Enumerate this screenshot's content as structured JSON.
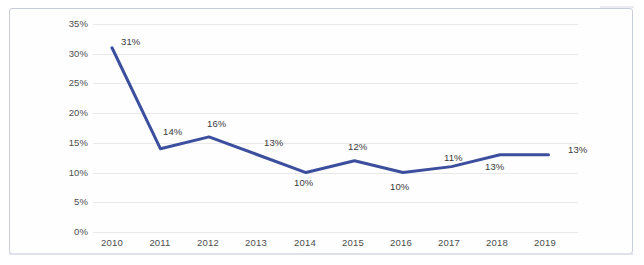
{
  "chart_data": {
    "type": "line",
    "title": "",
    "subtitle": "",
    "xlabel": "",
    "ylabel": "",
    "categories": [
      "2010",
      "2011",
      "2012",
      "2013",
      "2014",
      "2015",
      "2016",
      "2017",
      "2018",
      "2019"
    ],
    "values": [
      31,
      14,
      16,
      13,
      10,
      12,
      10,
      11,
      13,
      13
    ],
    "data_labels": [
      "31%",
      "14%",
      "16%",
      "13%",
      "10%",
      "12%",
      "10%",
      "11%",
      "13%",
      "13%"
    ],
    "series": [
      {
        "name": "",
        "values": [
          31,
          14,
          16,
          13,
          10,
          12,
          10,
          11,
          13,
          13
        ],
        "color": "#3c4f9e"
      }
    ],
    "ylim": [
      0,
      35
    ],
    "ytick_values": [
      0,
      5,
      10,
      15,
      20,
      25,
      30,
      35
    ],
    "ytick_labels": [
      "0%",
      "5%",
      "10%",
      "15%",
      "20%",
      "25%",
      "30%",
      "35%"
    ],
    "xtick_labels": [
      "2010",
      "2011",
      "2012",
      "2013",
      "2014",
      "2015",
      "2016",
      "2017",
      "2018",
      "2019"
    ],
    "grid": true,
    "grid_axis": "y",
    "legend": false,
    "legend_position": "none",
    "line_color": "#3c4f9e",
    "grid_color": "#e9e9ec",
    "tick_label_color": "#4d4d4d",
    "data_label_color": "#3a3a3a",
    "background_color": "#ffffff",
    "frame_color": "#c9cdd9",
    "markers": false,
    "line_width": 3
  }
}
